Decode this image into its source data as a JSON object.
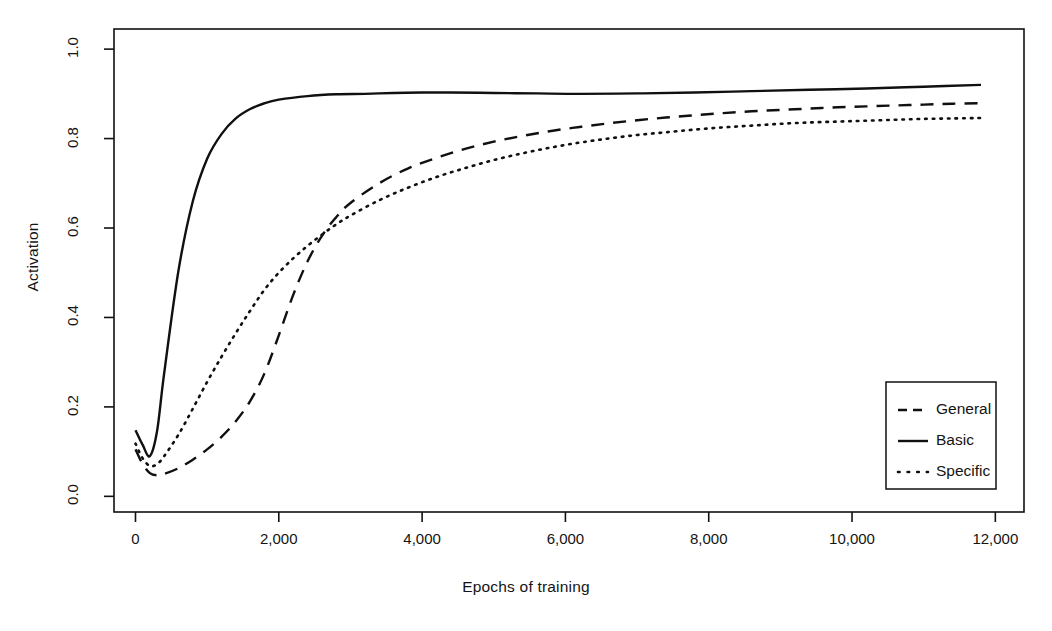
{
  "chart_data": {
    "type": "line",
    "title": "",
    "xlabel": "Epochs of training",
    "ylabel": "Activation",
    "xlim": [
      -300,
      12400
    ],
    "ylim": [
      -0.035,
      1.045
    ],
    "xticks": [
      0,
      2000,
      4000,
      6000,
      8000,
      10000,
      12000
    ],
    "xtick_labels": [
      "0",
      "2,000",
      "4,000",
      "6,000",
      "8,000",
      "10,000",
      "12,000"
    ],
    "yticks": [
      0.0,
      0.2,
      0.4,
      0.6,
      0.8,
      1.0
    ],
    "ytick_labels": [
      "0.0",
      "0.2",
      "0.4",
      "0.6",
      "0.8",
      "1.0"
    ],
    "grid": false,
    "box": true,
    "legend_position": "bottom-right",
    "line_color": "#101010",
    "series": [
      {
        "name": "General",
        "style": "dashed",
        "x": [
          0,
          100,
          200,
          300,
          400,
          600,
          800,
          1000,
          1200,
          1400,
          1600,
          1800,
          2000,
          2200,
          2400,
          2600,
          2800,
          3000,
          3400,
          3800,
          4200,
          4600,
          5000,
          5400,
          5800,
          6200,
          6600,
          7000,
          7400,
          7800,
          8200,
          8600,
          9000,
          9400,
          9800,
          10200,
          10600,
          11000,
          11400,
          11800
        ],
        "y": [
          0.105,
          0.072,
          0.052,
          0.047,
          0.05,
          0.063,
          0.082,
          0.105,
          0.133,
          0.168,
          0.213,
          0.275,
          0.36,
          0.45,
          0.525,
          0.582,
          0.624,
          0.656,
          0.7,
          0.733,
          0.757,
          0.777,
          0.793,
          0.806,
          0.817,
          0.826,
          0.834,
          0.841,
          0.847,
          0.852,
          0.857,
          0.861,
          0.864,
          0.867,
          0.87,
          0.872,
          0.874,
          0.876,
          0.878,
          0.879
        ]
      },
      {
        "name": "Basic",
        "style": "solid",
        "x": [
          0,
          100,
          200,
          300,
          400,
          600,
          800,
          1000,
          1200,
          1400,
          1600,
          1800,
          2000,
          2400,
          2800,
          3200,
          3600,
          4000,
          4400,
          5000,
          5600,
          6200,
          7000,
          7800,
          8600,
          9400,
          10200,
          11000,
          11800
        ],
        "y": [
          0.148,
          0.115,
          0.09,
          0.145,
          0.275,
          0.505,
          0.66,
          0.755,
          0.81,
          0.845,
          0.866,
          0.879,
          0.887,
          0.895,
          0.899,
          0.9,
          0.902,
          0.903,
          0.903,
          0.902,
          0.901,
          0.9,
          0.901,
          0.903,
          0.906,
          0.909,
          0.912,
          0.916,
          0.92
        ]
      },
      {
        "name": "Specific",
        "style": "dotted",
        "x": [
          0,
          100,
          200,
          300,
          400,
          600,
          800,
          1000,
          1200,
          1400,
          1600,
          1800,
          2000,
          2200,
          2400,
          2600,
          2800,
          3000,
          3400,
          3800,
          4200,
          4600,
          5000,
          5400,
          5800,
          6200,
          6600,
          7000,
          7400,
          7800,
          8200,
          8600,
          9000,
          9400,
          9800,
          10200,
          10600,
          11000,
          11400,
          11800
        ],
        "y": [
          0.118,
          0.085,
          0.068,
          0.072,
          0.09,
          0.138,
          0.196,
          0.256,
          0.312,
          0.365,
          0.415,
          0.462,
          0.5,
          0.532,
          0.56,
          0.585,
          0.608,
          0.628,
          0.662,
          0.69,
          0.714,
          0.734,
          0.752,
          0.767,
          0.78,
          0.791,
          0.8,
          0.808,
          0.814,
          0.82,
          0.825,
          0.829,
          0.833,
          0.836,
          0.838,
          0.84,
          0.842,
          0.844,
          0.845,
          0.846
        ]
      }
    ]
  },
  "legend": {
    "entries": [
      {
        "label": "General",
        "style": "dashed"
      },
      {
        "label": "Basic",
        "style": "solid"
      },
      {
        "label": "Specific",
        "style": "dotted"
      }
    ]
  }
}
